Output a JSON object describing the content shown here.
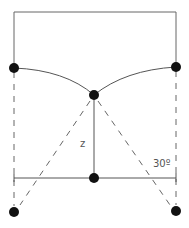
{
  "diagram": {
    "labels": {
      "height": "z",
      "angle": "30º"
    },
    "colors": {
      "line": "#555555",
      "node": "#111111",
      "background": "#ffffff"
    }
  }
}
